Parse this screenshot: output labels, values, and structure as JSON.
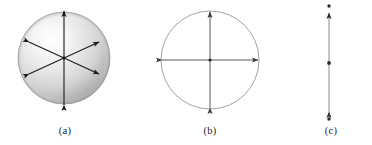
{
  "figure": {
    "title": "",
    "background_color": "#ffffff",
    "width": 372,
    "height": 145
  },
  "panels": [
    {
      "id": "a",
      "caption": "(a)",
      "shape": "shaded-sphere",
      "description": "Shaded three-dimensional sphere with three double-headed arrows radiating from the centre",
      "center": {
        "x": 64,
        "y": 58
      },
      "radius": 46,
      "fill": "radial-gradient-gray",
      "highlight_color": "#ffffff",
      "shadow_color": "#8e8e8e",
      "outline_color": "#9a9a9a",
      "arrow_color": "#1a1a1a",
      "arrows": [
        {
          "name": "vertical-axis-arrow",
          "angle_deg": 90,
          "length": 92,
          "double_headed": true
        },
        {
          "name": "diagonal-axis-arrow-up-right",
          "angle_deg": 25,
          "length": 76,
          "double_headed": true
        },
        {
          "name": "diagonal-axis-arrow-down-right",
          "angle_deg": -25,
          "length": 76,
          "double_headed": true
        }
      ]
    },
    {
      "id": "b",
      "caption": "(b)",
      "shape": "open-circle",
      "description": "Open circle outline with vertical and horizontal double-headed arrows through the centre",
      "center": {
        "x": 210,
        "y": 60
      },
      "radius": 49,
      "fill": "none",
      "outline_color": "#8a8a8a",
      "arrow_color": "#4a4a4a",
      "arrows": [
        {
          "name": "vertical-axis-arrow",
          "angle_deg": 90,
          "length": 98,
          "double_headed": true
        },
        {
          "name": "horizontal-axis-arrow",
          "angle_deg": 0,
          "length": 98,
          "double_headed": true
        }
      ]
    },
    {
      "id": "c",
      "caption": "(c)",
      "shape": "vertical-segment",
      "description": "Vertical double-headed arrow with dots at the centre and just beyond each arrowhead",
      "center": {
        "x": 329,
        "y": 63
      },
      "line_top": {
        "x": 329,
        "y": 13
      },
      "line_bottom": {
        "x": 329,
        "y": 112
      },
      "line_color": "#8a8a8a",
      "arrow_color": "#2a2a2a",
      "dot_color": "#2a2a2a",
      "arrows": [
        {
          "name": "vertical-axis-arrow",
          "angle_deg": 90,
          "length": 99,
          "double_headed": true
        }
      ],
      "dots": [
        {
          "name": "top-dot",
          "x": 329,
          "y": 6
        },
        {
          "name": "center-dot",
          "x": 329,
          "y": 63
        },
        {
          "name": "bottom-dot",
          "x": 329,
          "y": 119
        }
      ]
    }
  ],
  "colors": {
    "background": "#ffffff",
    "ink": "#1a1a1a",
    "outline_gray": "#8a8a8a",
    "sphere_light": "#ffffff",
    "sphere_mid": "#d8d8d8",
    "sphere_dark": "#8e8e8e"
  }
}
